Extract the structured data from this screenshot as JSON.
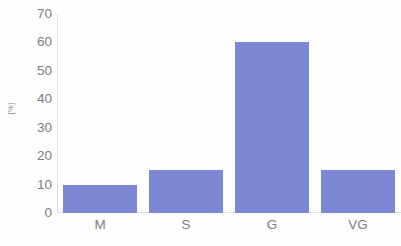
{
  "chart_data": {
    "type": "bar",
    "title": "",
    "subtitle": "",
    "xlabel": "",
    "ylabel": "[%]",
    "categories": [
      "M",
      "S",
      "G",
      "VG"
    ],
    "values": [
      10,
      15,
      60,
      15
    ],
    "series": [
      {
        "name": "",
        "values": [
          10,
          15,
          60,
          15
        ],
        "color": "#7b87d4"
      }
    ],
    "ylim": [
      0,
      70
    ],
    "ytick_values": [
      0,
      10,
      20,
      30,
      40,
      50,
      60,
      70
    ],
    "ytick_labels": [
      "0",
      "10",
      "20",
      "30",
      "40",
      "50",
      "60",
      "70"
    ],
    "grid": false,
    "legend": false,
    "legend_position": "none",
    "annotations": [],
    "data_labels": false
  },
  "colors": {
    "bar": "#7b87d4",
    "tick_text": "#7d7d7d",
    "axis_line": "#e0e0e0",
    "gridline": "#f7f7f7",
    "background": "#fefefe"
  }
}
